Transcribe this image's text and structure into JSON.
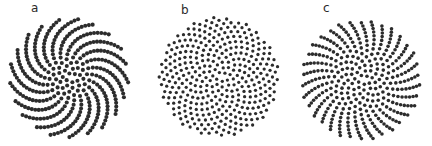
{
  "figure": {
    "background": "#ffffff",
    "kind": "phyllotaxis spiral dot patterns, three panels"
  },
  "chart_data": {
    "type": "scatter",
    "title": "",
    "model": "Vogel phyllotaxis: r = c*sqrt(n), theta = n*alpha",
    "dot_color": "#2c2c2c",
    "background": "#ffffff",
    "panels": [
      {
        "label": "a",
        "divergence_deg": 137.3,
        "n_points": 360,
        "scale_c": 3.15,
        "dot_radius": 2.05,
        "cx": 69,
        "cy": 78,
        "visible_spiral_arms": 21,
        "arm_drift": "clockwise",
        "label_pos": {
          "left": 31,
          "top": 2
        }
      },
      {
        "label": "b",
        "divergence_deg": 137.5,
        "n_points": 360,
        "scale_c": 3.15,
        "dot_radius": 1.65,
        "cx": 219,
        "cy": 77,
        "visible_spiral_arms": 0,
        "arm_drift": "none (uniform golden-angle packing)",
        "label_pos": {
          "left": 181,
          "top": 4
        }
      },
      {
        "label": "c",
        "divergence_deg": 137.6,
        "n_points": 360,
        "scale_c": 3.15,
        "dot_radius": 1.8,
        "cx": 361,
        "cy": 80,
        "visible_spiral_arms": 34,
        "arm_drift": "counterclockwise",
        "label_pos": {
          "left": 323,
          "top": 2
        }
      }
    ]
  }
}
